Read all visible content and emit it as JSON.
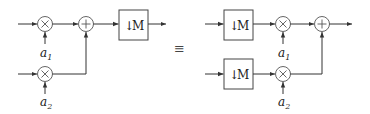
{
  "diagram": {
    "equivalence_symbol": "≡",
    "left": {
      "multiplier_1": {
        "symbol": "×",
        "coef": "a",
        "coef_sub": "1"
      },
      "multiplier_2": {
        "symbol": "×",
        "coef": "a",
        "coef_sub": "2"
      },
      "adder": {
        "symbol": "+"
      },
      "downsampler": {
        "arrow": "↓",
        "factor": "M"
      }
    },
    "right": {
      "downsampler_1": {
        "arrow": "↓",
        "factor": "M"
      },
      "downsampler_2": {
        "arrow": "↓",
        "factor": "M"
      },
      "multiplier_1": {
        "symbol": "×",
        "coef": "a",
        "coef_sub": "1"
      },
      "multiplier_2": {
        "symbol": "×",
        "coef": "a",
        "coef_sub": "2"
      },
      "adder": {
        "symbol": "+"
      }
    }
  }
}
